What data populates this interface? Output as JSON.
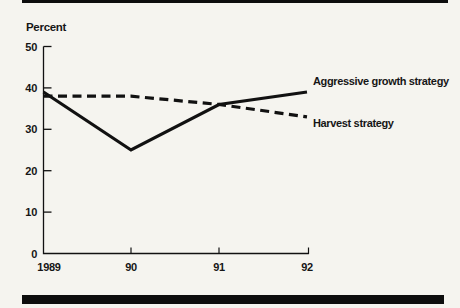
{
  "page": {
    "background": "#f5f4ef",
    "ink": "#111111"
  },
  "chart_data": {
    "type": "line",
    "title": "",
    "ylabel": "Percent",
    "xlabel": "",
    "categories": [
      "1989",
      "90",
      "91",
      "92"
    ],
    "series": [
      {
        "name": "Aggressive growth strategy",
        "style": "solid",
        "values": [
          39,
          25,
          36,
          39
        ]
      },
      {
        "name": "Harvest strategy",
        "style": "dashed",
        "values": [
          38,
          38,
          36,
          33
        ]
      }
    ],
    "ylim": [
      0,
      50
    ],
    "yticks": [
      0,
      10,
      20,
      30,
      40,
      50
    ],
    "grid": false,
    "legend_position": "inline-right-of-lines"
  }
}
